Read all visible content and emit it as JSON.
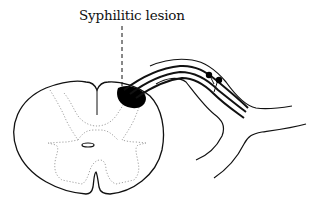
{
  "diagram": {
    "labels": {
      "lesion": "Syphilitic lesion"
    },
    "colors": {
      "stroke": "#111111",
      "lesion_fill": "#000000",
      "gray_matter_outline": "#8a8a8a",
      "background": "#ffffff"
    },
    "structures": [
      {
        "name": "spinal-cord-outline",
        "description": "Transverse section of spinal cord"
      },
      {
        "name": "gray-matter",
        "description": "Dotted butterfly-shaped gray matter"
      },
      {
        "name": "central-canal",
        "description": "Small oval central canal"
      },
      {
        "name": "dorsal-median-septum",
        "description": "Posterior median septum line"
      },
      {
        "name": "ventral-median-fissure",
        "description": "Anterior median fissure"
      },
      {
        "name": "syphilitic-lesion",
        "description": "Black lesion at dorsal root entry zone"
      },
      {
        "name": "dorsal-root",
        "description": "Dorsal root nerve fibres entering cord"
      },
      {
        "name": "dorsal-root-ganglion",
        "description": "Ganglion cells on the dorsal root"
      },
      {
        "name": "spinal-nerve",
        "description": "Spinal nerve sheath outline"
      }
    ]
  }
}
